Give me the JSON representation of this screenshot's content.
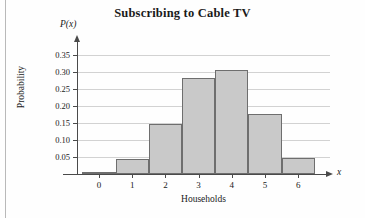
{
  "chart_data": {
    "type": "bar",
    "title": "Subscribing to Cable TV",
    "xlabel": "Households",
    "ylabel": "Probability",
    "x_axis_variable": "x",
    "y_axis_variable": "P(x)",
    "categories": [
      "0",
      "1",
      "2",
      "3",
      "4",
      "5",
      "6"
    ],
    "values": [
      0.005,
      0.045,
      0.147,
      0.282,
      0.306,
      0.176,
      0.047
    ],
    "ylim": [
      0,
      0.375
    ],
    "xlim": [
      -0.5,
      6.5
    ],
    "y_ticks": [
      0.05,
      0.1,
      0.15,
      0.2,
      0.25,
      0.3,
      0.35
    ],
    "y_tick_labels": [
      "0.05",
      "0.10",
      "0.15",
      "0.20",
      "0.25",
      "0.30",
      "0.35"
    ],
    "x_ticks": [
      0,
      1,
      2,
      3,
      4,
      5,
      6
    ],
    "x_tick_labels": [
      "0",
      "1",
      "2",
      "3",
      "4",
      "5",
      "6"
    ],
    "grid": true,
    "grid_axis": "y",
    "legend": false,
    "bar_fill_color": "#c9c9c9",
    "bar_edge_color": "#6e6e6e",
    "axis_color": "#4a4a4a",
    "grid_color": "#d2d2d2"
  }
}
